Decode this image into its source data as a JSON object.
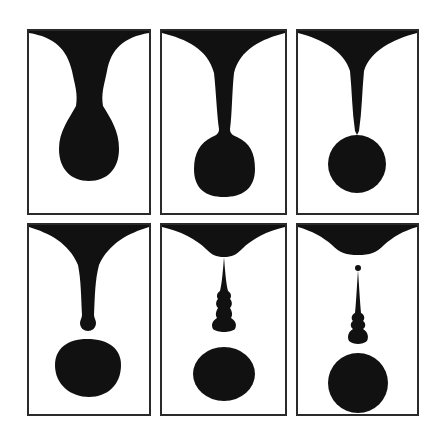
{
  "figure": {
    "layout": {
      "rows": 2,
      "columns": 3
    },
    "colors": {
      "ink": "#111111",
      "frame": "#2a2a2a",
      "background": "#ffffff"
    },
    "panels": [
      {
        "id": 1,
        "row": 1,
        "col": 1,
        "stage": "pendant-drop-forming",
        "shape": "teardrop hanging from funnel"
      },
      {
        "id": 2,
        "row": 1,
        "col": 2,
        "stage": "neck-thinning",
        "shape": "round drop attached by thin neck"
      },
      {
        "id": 3,
        "row": 1,
        "col": 3,
        "stage": "near-pinch-off",
        "shape": "spherical drop touching tapered thread"
      },
      {
        "id": 4,
        "row": 2,
        "col": 1,
        "stage": "detached-drop",
        "shape": "separated drop below thread with bulb tip"
      },
      {
        "id": 5,
        "row": 2,
        "col": 2,
        "stage": "satellite-beads",
        "shape": "thread with beads above falling drop"
      },
      {
        "id": 6,
        "row": 2,
        "col": 3,
        "stage": "thread-detached",
        "shape": "detached beaded thread and falling drop"
      }
    ]
  }
}
